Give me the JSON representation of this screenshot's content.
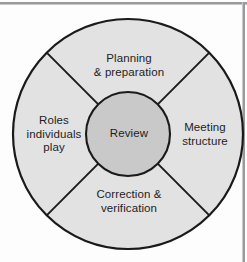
{
  "diagram": {
    "type": "cycle-wheel",
    "center": {
      "label": "Review"
    },
    "segments": [
      {
        "position": "top",
        "label": "Planning\n& preparation"
      },
      {
        "position": "right",
        "label": "Meeting\nstructure"
      },
      {
        "position": "bottom",
        "label": "Correction &\nverification"
      },
      {
        "position": "left",
        "label": "Roles\nindividuals\nplay"
      }
    ],
    "colors": {
      "outer_ring_fill": "#e2e2e2",
      "center_fill": "#c9c9c9",
      "stroke": "#1a1a1a",
      "text": "#1d1d1f",
      "background": "#fdfdfd",
      "edge_rule": "#9a9a9c"
    },
    "geometry": {
      "outer_radius": 115,
      "inner_radius": 42,
      "center_x": 128,
      "center_y": 134,
      "divider_angles_deg": [
        45,
        135,
        225,
        315
      ]
    }
  }
}
